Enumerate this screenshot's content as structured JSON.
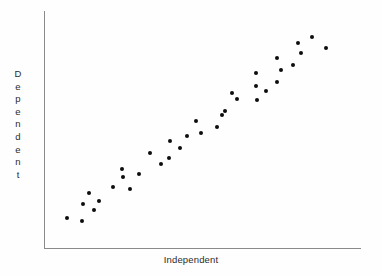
{
  "figure": {
    "background_color": "#fefefe",
    "axis_color": "#8a8a8a",
    "point_color": "#0d0d0d",
    "text_color": "#2c2c2c"
  },
  "labels": {
    "x_axis": "Independent",
    "y_axis": "Dependent",
    "y_axis_letters": [
      "D",
      "e",
      "p",
      "e",
      "n",
      "d",
      "e",
      "n",
      "t"
    ]
  },
  "chart_data": {
    "type": "scatter",
    "title": "",
    "xlabel": "Independent",
    "ylabel": "Dependent",
    "grid": false,
    "legend": null,
    "xlim": [
      0,
      100
    ],
    "ylim": [
      0,
      100
    ],
    "axis_ticks": {
      "x": [],
      "y": []
    },
    "n_points": 36,
    "series": [
      {
        "name": "observations",
        "marker": "filled-circle",
        "color": "#0d0d0d",
        "points_px": [
          [
            67,
            218
          ],
          [
            82,
            221
          ],
          [
            83,
            204
          ],
          [
            89,
            193
          ],
          [
            94,
            210
          ],
          [
            99,
            201
          ],
          [
            113,
            187
          ],
          [
            122,
            169
          ],
          [
            123,
            177
          ],
          [
            130,
            189
          ],
          [
            139,
            174
          ],
          [
            150,
            153
          ],
          [
            161,
            164
          ],
          [
            169,
            158
          ],
          [
            170,
            141
          ],
          [
            180,
            148
          ],
          [
            187,
            136
          ],
          [
            196,
            121
          ],
          [
            201,
            133
          ],
          [
            217,
            127
          ],
          [
            222,
            115
          ],
          [
            225,
            111
          ],
          [
            232,
            93
          ],
          [
            237,
            99
          ],
          [
            256,
            73
          ],
          [
            256,
            86
          ],
          [
            257,
            100
          ],
          [
            266,
            91
          ],
          [
            277,
            82
          ],
          [
            277,
            58
          ],
          [
            281,
            70
          ],
          [
            293,
            65
          ],
          [
            298,
            43
          ],
          [
            301,
            53
          ],
          [
            312,
            37
          ],
          [
            326,
            48
          ]
        ],
        "x": [
          7.3,
          12.0,
          12.3,
          14.2,
          15.8,
          17.4,
          21.8,
          24.6,
          24.9,
          27.1,
          30.0,
          33.4,
          36.9,
          39.4,
          39.7,
          42.9,
          45.1,
          48.0,
          49.5,
          54.6,
          56.2,
          57.1,
          59.3,
          60.9,
          66.9,
          66.9,
          67.2,
          70.1,
          73.5,
          73.5,
          74.8,
          78.6,
          80.1,
          81.1,
          84.5,
          88.9
        ],
        "y": [
          12.6,
          11.3,
          18.5,
          23.1,
          16.0,
          19.7,
          25.6,
          33.2,
          29.8,
          24.8,
          31.1,
          40.0,
          35.3,
          38.0,
          45.2,
          42.2,
          47.3,
          53.4,
          48.3,
          50.8,
          56.1,
          57.8,
          65.4,
          62.8,
          73.9,
          68.4,
          62.6,
          66.4,
          70.2,
          80.3,
          75.2,
          77.3,
          86.6,
          82.3,
          89.1,
          84.3
        ]
      }
    ]
  }
}
